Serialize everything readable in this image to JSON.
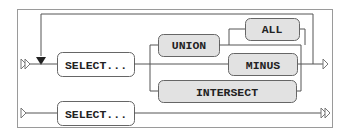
{
  "diagram": {
    "type": "railroad",
    "colors": {
      "terminal_fill": "#e2e2e2",
      "nonterminal_fill": "#ffffff",
      "line": "#555555",
      "frame": "#9a9a9a"
    },
    "row1": {
      "start": "select",
      "nonterminal": "SELECT...",
      "operators": {
        "union": "UNION",
        "all": "ALL",
        "minus": "MINUS",
        "intersect": "INTERSECT"
      }
    },
    "row2": {
      "nonterminal": "SELECT..."
    }
  }
}
